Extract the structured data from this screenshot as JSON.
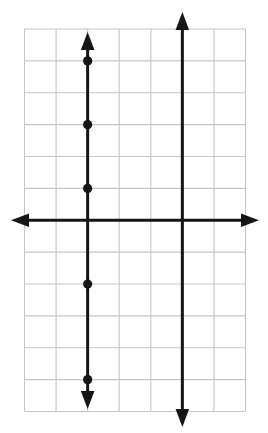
{
  "figure": {
    "width": 268,
    "height": 433,
    "background": "#ffffff",
    "ink_color": "#151515",
    "line_width": 3,
    "point_radius": 4.6,
    "arrowhead": {
      "length": 18,
      "half_width": 6.8
    },
    "grid": {
      "left": 24.5,
      "top": 29,
      "right": 245.5,
      "bottom": 411.5,
      "cols": 7,
      "rows": 12,
      "color": "#c5c5c5",
      "stroke_width": 1.1
    },
    "x_axis": {
      "row": 6,
      "tip_left_x": 11,
      "tip_right_x": 259
    },
    "y_axis": {
      "col": 2,
      "tip_top_y": 32,
      "tip_bottom_y": 409
    },
    "vertical_line": {
      "col": 5,
      "tip_top_y": 12,
      "tip_bottom_y": 427
    },
    "points": [
      {
        "col": 2,
        "row": 1
      },
      {
        "col": 2,
        "row": 3
      },
      {
        "col": 2,
        "row": 5
      },
      {
        "col": 2,
        "row": 8
      },
      {
        "col": 2,
        "row": 11
      }
    ]
  },
  "chart_data": {
    "type": "line",
    "title": "",
    "xlabel": "",
    "ylabel": "",
    "x_range": [
      -2,
      5
    ],
    "y_range": [
      -6,
      6
    ],
    "grid": true,
    "grid_step": 1,
    "legend": false,
    "axes": {
      "x_axis_y": 0,
      "y_axis_x": 0,
      "style": "arrows-both-ends",
      "tick_labels": "none"
    },
    "series": [
      {
        "name": "vertical-line",
        "equation": "x = 3",
        "points": [
          [
            3,
            -6.5
          ],
          [
            3,
            6.5
          ]
        ]
      }
    ],
    "scatter_points": [
      [
        0,
        5
      ],
      [
        0,
        3
      ],
      [
        0,
        1
      ],
      [
        0,
        -2
      ],
      [
        0,
        -5
      ]
    ]
  }
}
